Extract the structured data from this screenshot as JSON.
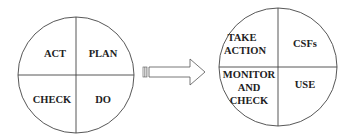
{
  "left_cycle": {
    "quadrants": {
      "top_left": "ACT",
      "top_right": "PLAN",
      "bottom_left": "CHECK",
      "bottom_right": "DO"
    }
  },
  "right_cycle": {
    "quadrants": {
      "top_left_line1": "TAKE",
      "top_left_line2": "ACTION",
      "top_right": "CSFs",
      "bottom_left_line1": "MONITOR",
      "bottom_left_line2": "AND",
      "bottom_left_line3": "CHECK",
      "bottom_right": "USE"
    }
  },
  "colors": {
    "stroke": "#333333",
    "text": "#222222"
  }
}
